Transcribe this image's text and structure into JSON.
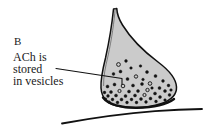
{
  "figure": {
    "panel_letter": "B",
    "caption_lines": [
      "ACh is",
      "stored",
      "in vesicles"
    ],
    "background_color": "#ffffff",
    "ink_color": "#1a1a1a",
    "cytoplasm_fill_color": "#cbcbcb",
    "membrane_outline_color": "#111111",
    "vesicle_fill_dark": "#141414",
    "vesicle_fill_open": "#cbcbcb",
    "parts": [
      {
        "name": "axon",
        "label": "axon stalk"
      },
      {
        "name": "axon-terminal",
        "label": "axon terminal bouton"
      },
      {
        "name": "synaptic-vesicles",
        "label": "synaptic vesicles containing ACh"
      },
      {
        "name": "postsynaptic-membrane",
        "label": "postsynaptic membrane"
      },
      {
        "name": "leader-line",
        "label": "leader line from caption to vesicles"
      }
    ],
    "vesicles": [
      {
        "cx": 118.5,
        "cy": 64.5,
        "r": 1.9,
        "filled": false
      },
      {
        "cx": 126.0,
        "cy": 61.0,
        "r": 1.4,
        "filled": true
      },
      {
        "cx": 131.0,
        "cy": 68.0,
        "r": 1.3,
        "filled": true
      },
      {
        "cx": 120.5,
        "cy": 71.5,
        "r": 1.5,
        "filled": true
      },
      {
        "cx": 113.5,
        "cy": 74.0,
        "r": 1.4,
        "filled": true
      },
      {
        "cx": 140.5,
        "cy": 66.0,
        "r": 1.3,
        "filled": true
      },
      {
        "cx": 147.0,
        "cy": 72.0,
        "r": 1.5,
        "filled": true
      },
      {
        "cx": 136.0,
        "cy": 76.5,
        "r": 1.7,
        "filled": false
      },
      {
        "cx": 127.5,
        "cy": 79.0,
        "r": 1.5,
        "filled": true
      },
      {
        "cx": 155.5,
        "cy": 76.0,
        "r": 1.5,
        "filled": true
      },
      {
        "cx": 163.0,
        "cy": 81.0,
        "r": 1.4,
        "filled": true
      },
      {
        "cx": 150.0,
        "cy": 83.5,
        "r": 1.8,
        "filled": false
      },
      {
        "cx": 142.0,
        "cy": 84.0,
        "r": 1.5,
        "filled": true
      },
      {
        "cx": 133.0,
        "cy": 85.5,
        "r": 1.5,
        "filled": true
      },
      {
        "cx": 123.0,
        "cy": 86.0,
        "r": 1.8,
        "filled": false
      },
      {
        "cx": 114.5,
        "cy": 84.5,
        "r": 1.5,
        "filled": true
      },
      {
        "cx": 107.5,
        "cy": 86.5,
        "r": 1.5,
        "filled": true
      },
      {
        "cx": 168.5,
        "cy": 85.5,
        "r": 1.4,
        "filled": true
      },
      {
        "cx": 159.5,
        "cy": 88.0,
        "r": 1.5,
        "filled": true
      },
      {
        "cx": 147.5,
        "cy": 90.0,
        "r": 1.7,
        "filled": false
      },
      {
        "cx": 138.0,
        "cy": 91.0,
        "r": 1.5,
        "filled": true
      },
      {
        "cx": 129.0,
        "cy": 91.5,
        "r": 1.5,
        "filled": true
      },
      {
        "cx": 119.5,
        "cy": 91.0,
        "r": 1.6,
        "filled": false
      },
      {
        "cx": 111.0,
        "cy": 92.0,
        "r": 1.5,
        "filled": true
      },
      {
        "cx": 104.5,
        "cy": 92.5,
        "r": 1.4,
        "filled": true
      },
      {
        "cx": 165.0,
        "cy": 91.0,
        "r": 1.5,
        "filled": true
      },
      {
        "cx": 155.0,
        "cy": 93.5,
        "r": 1.5,
        "filled": true
      },
      {
        "cx": 144.5,
        "cy": 95.0,
        "r": 1.6,
        "filled": false
      },
      {
        "cx": 135.0,
        "cy": 95.5,
        "r": 1.5,
        "filled": true
      },
      {
        "cx": 125.5,
        "cy": 96.0,
        "r": 1.5,
        "filled": true
      },
      {
        "cx": 116.0,
        "cy": 95.5,
        "r": 1.5,
        "filled": true
      },
      {
        "cx": 108.0,
        "cy": 96.0,
        "r": 1.4,
        "filled": true
      },
      {
        "cx": 171.0,
        "cy": 90.0,
        "r": 1.3,
        "filled": true
      },
      {
        "cx": 169.5,
        "cy": 95.0,
        "r": 1.4,
        "filled": true
      },
      {
        "cx": 160.0,
        "cy": 97.0,
        "r": 1.5,
        "filled": true
      },
      {
        "cx": 150.5,
        "cy": 98.5,
        "r": 1.5,
        "filled": true
      },
      {
        "cx": 141.0,
        "cy": 99.0,
        "r": 1.5,
        "filled": true
      },
      {
        "cx": 131.5,
        "cy": 99.5,
        "r": 1.4,
        "filled": true
      },
      {
        "cx": 121.5,
        "cy": 99.5,
        "r": 1.5,
        "filled": true
      },
      {
        "cx": 112.5,
        "cy": 99.5,
        "r": 1.4,
        "filled": true
      },
      {
        "cx": 105.5,
        "cy": 99.0,
        "r": 1.3,
        "filled": true
      },
      {
        "cx": 165.0,
        "cy": 100.0,
        "r": 1.3,
        "filled": true
      },
      {
        "cx": 156.0,
        "cy": 101.5,
        "r": 1.4,
        "filled": true
      },
      {
        "cx": 146.0,
        "cy": 102.0,
        "r": 1.4,
        "filled": true
      },
      {
        "cx": 136.5,
        "cy": 102.5,
        "r": 1.4,
        "filled": true
      },
      {
        "cx": 127.0,
        "cy": 102.5,
        "r": 1.4,
        "filled": true
      },
      {
        "cx": 117.5,
        "cy": 102.5,
        "r": 1.4,
        "filled": true
      },
      {
        "cx": 109.0,
        "cy": 102.0,
        "r": 1.3,
        "filled": true
      },
      {
        "cx": 152.0,
        "cy": 88.0,
        "r": 1.3,
        "filled": true
      },
      {
        "cx": 143.0,
        "cy": 79.5,
        "r": 1.3,
        "filled": true
      }
    ]
  }
}
